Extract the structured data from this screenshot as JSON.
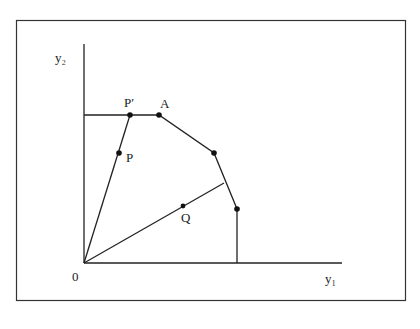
{
  "diagram": {
    "type": "production-possibility-frontier",
    "axes": {
      "x_label": "y₁",
      "y_label": "y₂",
      "origin_label": "0"
    },
    "points": [
      {
        "id": "P_prime",
        "label": "P′"
      },
      {
        "id": "A",
        "label": "A"
      },
      {
        "id": "P",
        "label": "P"
      },
      {
        "id": "Q",
        "label": "Q"
      }
    ],
    "colors": {
      "line": "#222222",
      "frame": "#333333",
      "background": "#ffffff"
    }
  }
}
